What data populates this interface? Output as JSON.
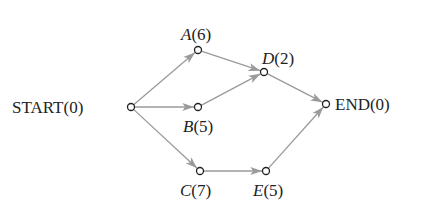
{
  "diagram": {
    "type": "activity-network",
    "colors": {
      "edge": "#9a9a9a",
      "node_stroke": "#222222",
      "text": "#222222",
      "background": "#ffffff"
    },
    "nodes": [
      {
        "id": "START",
        "name": "START",
        "duration": "(0)",
        "italic": false,
        "x": 131,
        "y": 107
      },
      {
        "id": "A",
        "name": "A",
        "duration": "(6)",
        "italic": true,
        "x": 198,
        "y": 50
      },
      {
        "id": "B",
        "name": "B",
        "duration": "(5)",
        "italic": true,
        "x": 198,
        "y": 107
      },
      {
        "id": "C",
        "name": "C",
        "duration": "(7)",
        "italic": true,
        "x": 200,
        "y": 171
      },
      {
        "id": "D",
        "name": "D",
        "duration": "(2)",
        "italic": true,
        "x": 264,
        "y": 72
      },
      {
        "id": "E",
        "name": "E",
        "duration": "(5)",
        "italic": true,
        "x": 266,
        "y": 171
      },
      {
        "id": "END",
        "name": "END",
        "duration": "(0)",
        "italic": false,
        "x": 326,
        "y": 104
      }
    ],
    "edges": [
      {
        "from": "START",
        "to": "A"
      },
      {
        "from": "START",
        "to": "B"
      },
      {
        "from": "START",
        "to": "C"
      },
      {
        "from": "A",
        "to": "D"
      },
      {
        "from": "B",
        "to": "D"
      },
      {
        "from": "D",
        "to": "END"
      },
      {
        "from": "C",
        "to": "E"
      },
      {
        "from": "E",
        "to": "END"
      }
    ]
  },
  "labels": {
    "start": {
      "name": "START",
      "duration": "(0)"
    },
    "a": {
      "name": "A",
      "duration": "(6)"
    },
    "b": {
      "name": "B",
      "duration": "(5)"
    },
    "c": {
      "name": "C",
      "duration": "(7)"
    },
    "d": {
      "name": "D",
      "duration": "(2)"
    },
    "e": {
      "name": "E",
      "duration": "(5)"
    },
    "end": {
      "name": "END",
      "duration": "(0)"
    }
  }
}
